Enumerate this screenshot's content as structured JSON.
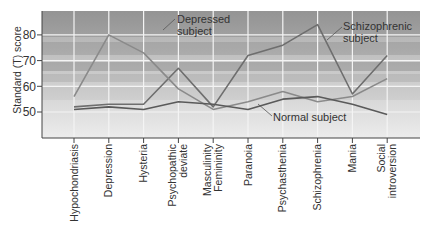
{
  "chart_data": {
    "type": "line",
    "title": "",
    "xlabel": "",
    "ylabel": "Standard (T) score",
    "ylim": [
      41,
      90
    ],
    "yticks": [
      50,
      60,
      70,
      80
    ],
    "grid": true,
    "categories": [
      "Hypochondriasis",
      "Depression",
      "Hysteria",
      "Psychopathic deviate",
      "Masculinity Femininity",
      "Paranoia",
      "Psychasthenia",
      "Schizophrenia",
      "Mania",
      "Social introversion"
    ],
    "series": [
      {
        "name": "Schizophrenic subject",
        "color": "#6e6e6e",
        "values": [
          52,
          53,
          53,
          67,
          52,
          72,
          76,
          84,
          57,
          72
        ]
      },
      {
        "name": "Depressed subject",
        "color": "#8a8a8a",
        "values": [
          56,
          80,
          73,
          59,
          51,
          54,
          58,
          54,
          56,
          63
        ]
      },
      {
        "name": "Normal subject",
        "color": "#5a5a5a",
        "values": [
          51,
          52,
          51,
          54,
          53,
          51,
          55,
          56,
          53,
          49
        ]
      }
    ],
    "annotations": [
      {
        "text": "Depressed subject",
        "target": "Depressed subject"
      },
      {
        "text": "Schizophrenic subject",
        "target": "Schizophrenic subject"
      },
      {
        "text": "Normal subject",
        "target": "Normal subject"
      }
    ]
  },
  "labels": {
    "ylabel": "Standard (T) score",
    "yticks": [
      "80",
      "70",
      "60",
      "50"
    ],
    "x": [
      [
        "Hypochondriasis"
      ],
      [
        "Depression"
      ],
      [
        "Hysteria"
      ],
      [
        "Psychopathic",
        "deviate"
      ],
      [
        "Masculinity",
        "Femininity"
      ],
      [
        "Paranoia"
      ],
      [
        "Psychasthenia"
      ],
      [
        "Schizophrenia"
      ],
      [
        "Mania"
      ],
      [
        "Social",
        "introversion"
      ]
    ],
    "ann_depressed": [
      "Depressed",
      "subject"
    ],
    "ann_schizo": [
      "Schizophrenic",
      "subject"
    ],
    "ann_normal": "Normal subject"
  }
}
